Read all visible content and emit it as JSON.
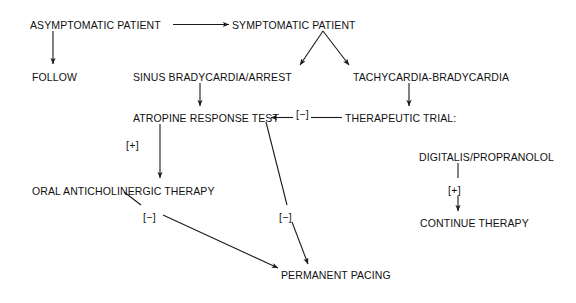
{
  "diagram": {
    "type": "clinical-flowchart",
    "background_color": "#ffffff",
    "line_color": "#1a1a1a",
    "text_color": "#111111",
    "nodes": [
      {
        "id": "asymptomatic",
        "label": "ASYMPTOMATIC PATIENT",
        "x": 30,
        "y": 20
      },
      {
        "id": "symptomatic",
        "label": "SYMPTOMATIC PATIENT",
        "x": 232,
        "y": 20
      },
      {
        "id": "follow",
        "label": "FOLLOW",
        "x": 32,
        "y": 72
      },
      {
        "id": "sinus",
        "label": "SINUS BRADYCARDIA/ARREST",
        "x": 133,
        "y": 72
      },
      {
        "id": "tachybrady",
        "label": "TACHYCARDIA-BRADYCARDIA",
        "x": 353,
        "y": 72
      },
      {
        "id": "atropine",
        "label": "ATROPINE RESPONSE TEST",
        "x": 133,
        "y": 113
      },
      {
        "id": "therapeutic",
        "label": "THERAPEUTIC TRIAL:",
        "x": 345,
        "y": 113
      },
      {
        "id": "digitalis",
        "label": "DIGITALIS/PROPRANOLOL",
        "x": 419,
        "y": 152
      },
      {
        "id": "oral",
        "label": "ORAL ANTICHOLINERGIC THERAPY",
        "x": 32,
        "y": 186
      },
      {
        "id": "continue",
        "label": "CONTINUE THERAPY",
        "x": 420,
        "y": 218
      },
      {
        "id": "pacing",
        "label": "PERMANENT PACING",
        "x": 281,
        "y": 270
      }
    ],
    "edge_labels": [
      {
        "id": "atropine-positive",
        "label": "[+]",
        "x": 126,
        "y": 140
      },
      {
        "id": "therapeutic-minus",
        "label": "[−]",
        "x": 296,
        "y": 109
      },
      {
        "id": "atropine-negative",
        "label": "[−]",
        "x": 279,
        "y": 212
      },
      {
        "id": "oral-negative",
        "label": "[−]",
        "x": 143,
        "y": 212
      },
      {
        "id": "digitalis-positive",
        "label": "[+]",
        "x": 448,
        "y": 185
      }
    ],
    "edges": [
      {
        "id": "asymptomatic-to-symptomatic",
        "from": "asymptomatic",
        "to": "symptomatic",
        "kind": "horizontal-arrow"
      },
      {
        "id": "asymptomatic-to-follow",
        "from": "asymptomatic",
        "to": "follow",
        "kind": "vertical-arrow"
      },
      {
        "id": "symptomatic-to-sinus",
        "from": "symptomatic",
        "to": "sinus",
        "kind": "diagonal-arrow"
      },
      {
        "id": "symptomatic-to-tachybrady",
        "from": "symptomatic",
        "to": "tachybrady",
        "kind": "diagonal-arrow"
      },
      {
        "id": "sinus-to-atropine",
        "from": "sinus",
        "to": "atropine",
        "kind": "vertical-arrow"
      },
      {
        "id": "tachybrady-to-therapeutic",
        "from": "tachybrady",
        "to": "therapeutic",
        "kind": "vertical-arrow"
      },
      {
        "id": "therapeutic-to-atropine",
        "from": "therapeutic",
        "to": "atropine",
        "kind": "horizontal-arrow-left",
        "label": "[−]"
      },
      {
        "id": "atropine-to-oral",
        "from": "atropine",
        "to": "oral",
        "kind": "vertical-arrow",
        "label": "[+]"
      },
      {
        "id": "atropine-to-pacing",
        "from": "atropine",
        "to": "pacing",
        "kind": "diagonal-arrow",
        "label": "[−]"
      },
      {
        "id": "oral-to-pacing",
        "from": "oral",
        "to": "pacing",
        "kind": "diagonal-arrow",
        "label": "[−]"
      },
      {
        "id": "therapeutic-to-digitalis",
        "from": "therapeutic",
        "to": "digitalis",
        "kind": "implied"
      },
      {
        "id": "digitalis-to-continue",
        "from": "digitalis",
        "to": "continue",
        "kind": "vertical-arrow",
        "label": "[+]"
      }
    ]
  }
}
